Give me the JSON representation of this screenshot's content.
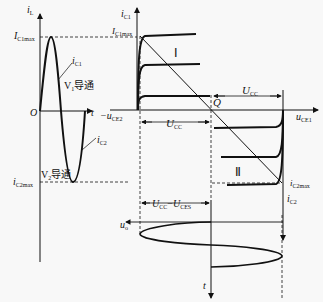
{
  "left_plot": {
    "y_axis_label": "i",
    "y_axis_sub": "L",
    "origin_label": "O",
    "x_axis_label": "t",
    "max_label": "I",
    "max_sub": "C1max",
    "min_label": "i",
    "min_sub": "C2max",
    "ic1_label": "i",
    "ic1_sub": "C1",
    "ic2_label": "i",
    "ic2_sub": "C2",
    "v1_label": "V",
    "v1_sub": "1",
    "v1_text": "导通",
    "v2_label": "V",
    "v2_sub": "2",
    "v2_text": "导通"
  },
  "right_plot": {
    "ic1_axis_label": "i",
    "ic1_axis_sub": "C1",
    "ic1max_label": "I",
    "ic1max_sub": "C1max",
    "region1_label": "Ⅰ",
    "region2_label": "Ⅱ",
    "q_label": "Q",
    "ucc_label": "U",
    "ucc_sub": "CC",
    "ucc_left_label": "U",
    "ucc_left_sub": "CC",
    "uce1_label": "u",
    "uce1_sub": "CE1",
    "uce2_label": "−u",
    "uce2_sub": "CE2",
    "ic2max_label": "i",
    "ic2max_sub": "C2max",
    "ic2_axis_label": "i",
    "ic2_axis_sub": "C2",
    "swing_label_a": "U",
    "swing_sub_a": "CC",
    "swing_minus": "−",
    "swing_label_b": "U",
    "swing_sub_b": "CES",
    "uo_label": "u",
    "uo_sub": "o",
    "t_label": "t"
  }
}
